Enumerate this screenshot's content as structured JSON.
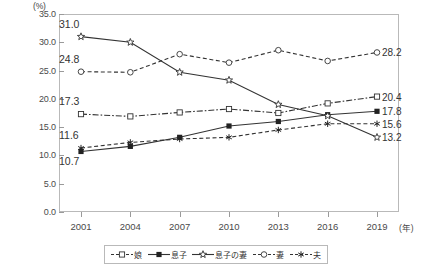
{
  "chart_data": {
    "type": "line",
    "title": "",
    "xlabel": "年",
    "ylabel": "(%)",
    "ylim": [
      0.0,
      35.0
    ],
    "ytick_labels": [
      "0.0",
      "5.0",
      "10.0",
      "15.0",
      "20.0",
      "25.0",
      "30.0",
      "35.0"
    ],
    "ytick_values": [
      0.0,
      5.0,
      10.0,
      15.0,
      20.0,
      25.0,
      30.0,
      35.0
    ],
    "grid": false,
    "legend_position": "bottom",
    "categories": [
      "2001",
      "2004",
      "2007",
      "2010",
      "2013",
      "2016",
      "2019"
    ],
    "series": [
      {
        "name": "娘",
        "marker": "open-square",
        "line": "dash-dot",
        "values": [
          17.3,
          16.9,
          17.6,
          18.2,
          17.5,
          19.2,
          20.4
        ]
      },
      {
        "name": "息子",
        "marker": "filled-square",
        "line": "solid",
        "values": [
          10.7,
          11.6,
          13.2,
          15.2,
          16.0,
          17.2,
          17.8
        ]
      },
      {
        "name": "息子の妻",
        "marker": "open-star",
        "line": "solid",
        "values": [
          31.0,
          30.0,
          24.7,
          23.3,
          19.0,
          17.0,
          13.2
        ]
      },
      {
        "name": "妻",
        "marker": "open-circle",
        "line": "dashed",
        "values": [
          24.8,
          24.7,
          27.9,
          26.4,
          28.6,
          26.7,
          28.2
        ]
      },
      {
        "name": "夫",
        "marker": "asterisk",
        "line": "dashed",
        "values": [
          11.3,
          12.3,
          12.9,
          13.2,
          14.5,
          15.6,
          15.6
        ]
      }
    ],
    "start_labels": [
      {
        "text": "31.0",
        "series": "息子の妻"
      },
      {
        "text": "24.8",
        "series": "妻"
      },
      {
        "text": "17.3",
        "series": "娘"
      },
      {
        "text": "11.6",
        "series": "夫"
      },
      {
        "text": "10.7",
        "series": "息子"
      }
    ],
    "end_labels": [
      {
        "text": "28.2",
        "series": "妻"
      },
      {
        "text": "20.4",
        "series": "娘"
      },
      {
        "text": "17.8",
        "series": "息子"
      },
      {
        "text": "15.6",
        "series": "夫"
      },
      {
        "text": "13.2",
        "series": "息子の妻"
      }
    ]
  }
}
